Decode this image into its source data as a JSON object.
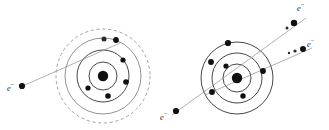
{
  "figure": {
    "background_color": "#ffffff",
    "ink_color": "#101010",
    "trajectory_color": "#8e8e8e",
    "width": 329,
    "height": 130
  },
  "panels": [
    {
      "id": "before",
      "name": "incident-electron-approaching-atom",
      "atom": {
        "nucleus": {
          "cx": 103,
          "cy": 76,
          "r": 5.2
        },
        "shells": [
          {
            "index": 1,
            "r": 14,
            "style": "solid"
          },
          {
            "index": 2,
            "r": 26,
            "style": "solid"
          },
          {
            "index": 3,
            "r": 38,
            "style": "solid"
          },
          {
            "index": 4,
            "r": 47,
            "style": "dashed"
          }
        ],
        "bound_electrons": [
          {
            "cx": 123,
            "cy": 60,
            "r": 2.6,
            "shell": 2
          },
          {
            "cx": 126,
            "cy": 82,
            "r": 2.8,
            "shell": 2
          },
          {
            "cx": 88,
            "cy": 88,
            "r": 2.6,
            "shell": 2
          },
          {
            "cx": 108,
            "cy": 96,
            "r": 2.8,
            "shell": 2
          },
          {
            "cx": 116,
            "cy": 40,
            "r": 2.9,
            "shell": 3
          },
          {
            "cx": 104,
            "cy": 39,
            "r": 2.5,
            "shell": 3
          }
        ]
      },
      "incident": {
        "label": "e",
        "charge_superscript": "−",
        "label_x": 8,
        "label_y": 89,
        "electron": {
          "cx": 22,
          "cy": 86,
          "r": 3.1
        },
        "path": "M 25 85 L 120 43"
      }
    },
    {
      "id": "after",
      "name": "scattered-and-ejected-electrons",
      "atom": {
        "nucleus": {
          "cx": 237,
          "cy": 78,
          "r": 5.2
        },
        "shells": [
          {
            "index": 1,
            "r": 14,
            "style": "solid"
          },
          {
            "index": 2,
            "r": 25,
            "style": "solid"
          },
          {
            "index": 3,
            "r": 36,
            "style": "solid"
          }
        ],
        "bound_electrons": [
          {
            "cx": 228,
            "cy": 43,
            "r": 3.1,
            "shell": 3
          },
          {
            "cx": 263,
            "cy": 71,
            "r": 2.9,
            "shell": 2
          },
          {
            "cx": 211,
            "cy": 62,
            "r": 2.9,
            "shell": 2
          },
          {
            "cx": 212,
            "cy": 92,
            "r": 2.9,
            "shell": 2
          },
          {
            "cx": 243,
            "cy": 96,
            "r": 2.7,
            "shell": 2
          },
          {
            "cx": 226,
            "cy": 66,
            "r": 2.6,
            "shell": 1
          }
        ]
      },
      "outgoing": [
        {
          "id": "scattered",
          "label": "e",
          "charge_superscript": "−",
          "label_x": 300,
          "label_y": 7,
          "path": "M 172 115 L 306 18",
          "electrons": [
            {
              "cx": 294,
              "cy": 23,
              "r": 3.2
            },
            {
              "cx": 287,
              "cy": 28,
              "r": 1.5
            }
          ]
        },
        {
          "id": "ejected",
          "label": "e",
          "charge_superscript": "−",
          "label_x": 308,
          "label_y": 42,
          "path": "M 205 95 L 312 48",
          "electrons": [
            {
              "cx": 303,
              "cy": 49,
              "r": 3.0
            },
            {
              "cx": 295,
              "cy": 51,
              "r": 1.6
            },
            {
              "cx": 289,
              "cy": 53,
              "r": 1.2
            }
          ]
        },
        {
          "id": "incident-tail",
          "label": "e",
          "charge_superscript": "−",
          "label_x": 160,
          "label_y": 117,
          "path": "",
          "electrons": [
            {
              "cx": 176,
              "cy": 111,
              "r": 3.1
            }
          ]
        }
      ]
    }
  ],
  "labels": {
    "electron_symbol": "e",
    "negative_sign": "−"
  }
}
